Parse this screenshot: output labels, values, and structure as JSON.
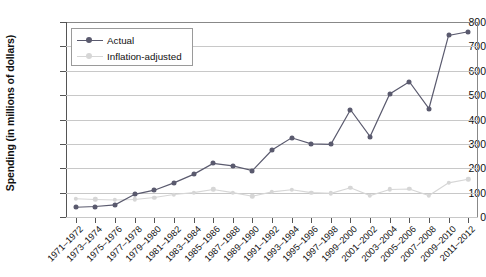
{
  "chart_data": {
    "type": "line",
    "title": "",
    "xlabel": "",
    "ylabel": "Spending (in millions of dollars)",
    "ylim": [
      0,
      800
    ],
    "yticks": [
      0,
      100,
      200,
      300,
      400,
      500,
      600,
      700,
      800
    ],
    "grid": true,
    "legend_position": "top-left",
    "categories": [
      "1971–1972",
      "1973–1974",
      "1975–1976",
      "1977–1978",
      "1979–1980",
      "1981–1982",
      "1983–1984",
      "1985–1986",
      "1987–1988",
      "1989–1990",
      "1991–1992",
      "1993–1994",
      "1995–1996",
      "1997–1998",
      "1999–2000",
      "2001–2002",
      "2003–2004",
      "2005–2006",
      "2007–2008",
      "2009–2010",
      "2011–2012"
    ],
    "series": [
      {
        "name": "Actual",
        "color": "#5a5a6e",
        "marker": "circle",
        "values": [
          40,
          43,
          50,
          93,
          110,
          140,
          175,
          220,
          210,
          190,
          275,
          325,
          300,
          298,
          440,
          330,
          505,
          555,
          445,
          745,
          760
        ]
      },
      {
        "name": "Inflation-adjusted",
        "color": "#d6d6d6",
        "marker": "circle",
        "values": [
          75,
          72,
          70,
          72,
          80,
          92,
          100,
          113,
          100,
          85,
          103,
          112,
          100,
          97,
          120,
          88,
          113,
          115,
          88,
          140,
          155
        ]
      }
    ]
  },
  "legend": {
    "items": [
      {
        "label": "Actual"
      },
      {
        "label": "Inflation-adjusted"
      }
    ]
  },
  "colors": {
    "actual": "#5a5a6e",
    "inflation_adjusted": "#d6d6d6",
    "grid": "#c8c8c8",
    "axis": "#555555",
    "background": "#ffffff"
  }
}
